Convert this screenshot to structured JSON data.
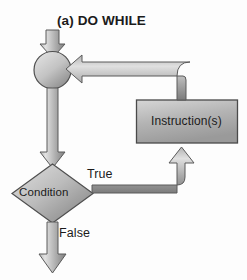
{
  "diagram": {
    "title": "(a) DO WHILE",
    "type": "flowchart",
    "nodes": {
      "start_connector": {
        "shape": "circle",
        "label": "",
        "name": "merge-connector-circle"
      },
      "condition": {
        "shape": "diamond",
        "label": "Condition",
        "name": "condition-decision"
      },
      "instruction": {
        "shape": "rectangle",
        "label": "Instruction(s)",
        "name": "instruction-process"
      }
    },
    "edges": {
      "entry": {
        "label": "",
        "from": "entry-point",
        "to": "start_connector"
      },
      "connector_to_condition": {
        "label": "",
        "from": "start_connector",
        "to": "condition"
      },
      "condition_true": {
        "label": "True",
        "from": "condition",
        "to": "instruction"
      },
      "condition_false": {
        "label": "False",
        "from": "condition",
        "to": "exit-point"
      },
      "instruction_loopback": {
        "label": "",
        "from": "instruction",
        "to": "start_connector"
      }
    },
    "colors": {
      "shape_fill_light": "#d2d2d2",
      "shape_fill_dark": "#8d8d8d",
      "arrow_fill_light": "#c9c9c9",
      "arrow_fill_dark": "#8a8a8a",
      "stroke": "#4a4a4a",
      "text": "#1b1b1b",
      "background": "#fdfdfd"
    }
  }
}
